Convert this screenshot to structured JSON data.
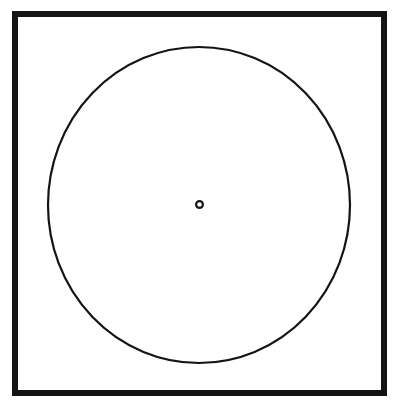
{
  "figure": {
    "title": "Square frame enclosing a circle with a centered point",
    "kind": "line-drawing",
    "canvas": {
      "width": 398,
      "height": 407,
      "background_color": "#ffffff"
    },
    "ink_color": "#141414",
    "shapes": {
      "outer_frame": {
        "name": "square-frame",
        "label": "Outer square border",
        "x": 15,
        "y": 14,
        "width": 369,
        "height": 379,
        "stroke_width": 6,
        "stroke_color": "#141414",
        "fill": "none"
      },
      "main_circle": {
        "name": "inscribed-circle",
        "label": "Inscribed circle",
        "cx": 199,
        "cy": 205,
        "rx": 151,
        "ry": 158,
        "stroke_width": 2.2,
        "stroke_color": "#141414",
        "fill": "none"
      },
      "center_point": {
        "name": "center-point",
        "label": "Center point",
        "cx": 199.5,
        "cy": 204.5,
        "r": 3.4,
        "stroke_width": 2.2,
        "stroke_color": "#141414",
        "fill": "none"
      }
    }
  }
}
